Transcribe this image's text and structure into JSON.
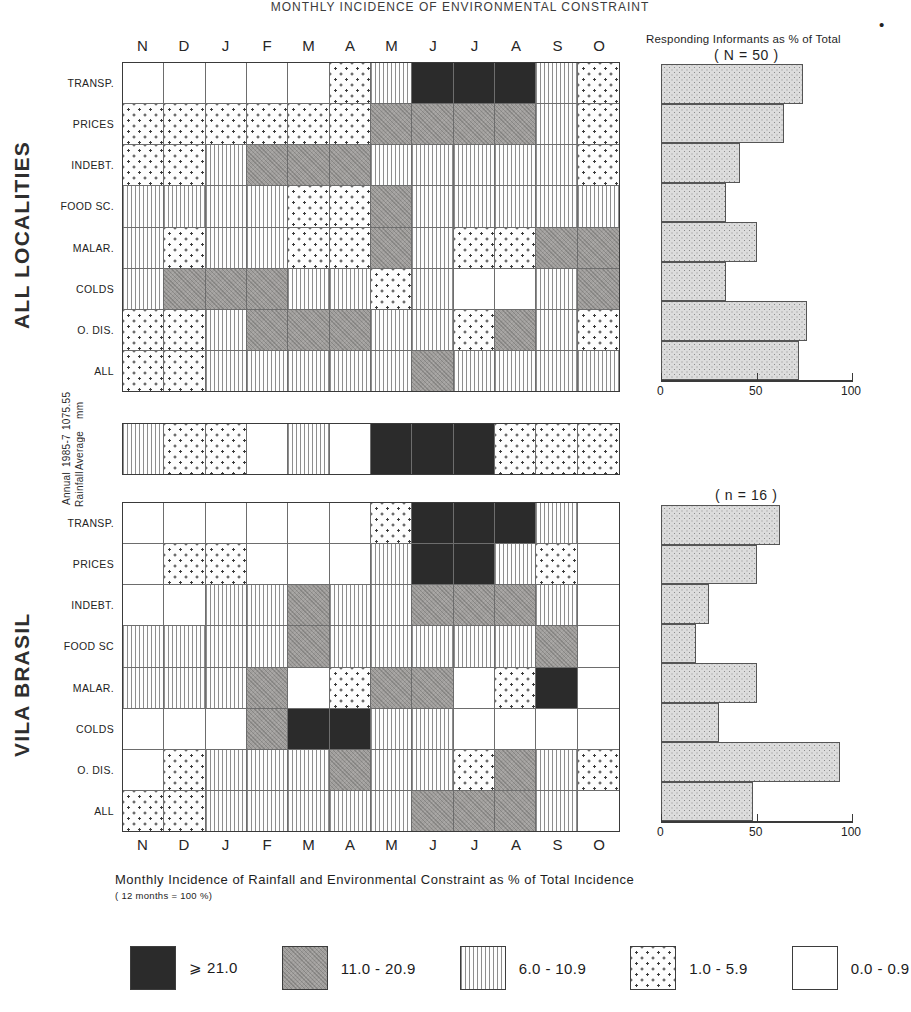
{
  "figure": {
    "top_title": "MONTHLY INCIDENCE OF ENVIRONMENTAL CONSTRAINT",
    "section_top_label": "ALL LOCALITIES",
    "section_bottom_label": "VILA BRASIL",
    "caption_line1": "Monthly Incidence of Rainfall and Environmental Constraint as % of Total Incidence",
    "caption_line2": "( 12 months = 100 %)",
    "asterisk": "•"
  },
  "months": [
    "N",
    "D",
    "J",
    "F",
    "M",
    "A",
    "M",
    "J",
    "J",
    "A",
    "S",
    "O"
  ],
  "constraint_rows": [
    "TRANSP.",
    "PRICES",
    "INDEBT.",
    "FOOD SC.",
    "MALAR.",
    "COLDS",
    "O. DIS.",
    "ALL"
  ],
  "constraint_rows_bottom": [
    "TRANSP.",
    "PRICES",
    "INDEBT.",
    "FOOD SC",
    "MALAR.",
    "COLDS",
    "O. DIS.",
    "ALL"
  ],
  "rainfall": {
    "label_line1": "Annual Rainfall",
    "label_line2": "1985-7 Average",
    "label_line3": "1075.55 mm"
  },
  "bar_panel_top": {
    "title": "Responding Informants as % of Total",
    "subtitle": "( N = 50 )",
    "axis_ticks": [
      "0",
      "50",
      "100"
    ]
  },
  "bar_panel_bottom": {
    "subtitle": "( n = 16 )",
    "axis_ticks": [
      "0",
      "50",
      "100"
    ]
  },
  "legend": {
    "items": [
      {
        "pattern": "black",
        "label": "⩾ 21.0"
      },
      {
        "pattern": "gray",
        "label": "11.0 - 20.9"
      },
      {
        "pattern": "lines",
        "label": "6.0 - 10.9"
      },
      {
        "pattern": "dots",
        "label": "1.0 - 5.9"
      },
      {
        "pattern": "white",
        "label": "0.0 - 0.9"
      }
    ]
  },
  "chart_data": {
    "type": "heatmap",
    "title": "Monthly Incidence of Rainfall and Environmental Constraint as % of Total Incidence",
    "subtitle": "( 12 months = 100 %)",
    "xlabel": "",
    "ylabel": "",
    "x": [
      "N",
      "D",
      "J",
      "F",
      "M",
      "A",
      "M",
      "J",
      "J",
      "A",
      "S",
      "O"
    ],
    "grid": true,
    "legend_position": "bottom",
    "class_bins": [
      {
        "name": "black",
        "range": "⩾ 21.0",
        "min": 21.0,
        "max": null
      },
      {
        "name": "gray",
        "range": "11.0 - 20.9",
        "min": 11.0,
        "max": 20.9
      },
      {
        "name": "lines",
        "range": "6.0 - 10.9",
        "min": 6.0,
        "max": 10.9
      },
      {
        "name": "dots",
        "range": "1.0 - 5.9",
        "min": 1.0,
        "max": 5.9
      },
      {
        "name": "white",
        "range": "0.0 - 0.9",
        "min": 0.0,
        "max": 0.9
      }
    ],
    "panels": [
      {
        "name": "ALL LOCALITIES",
        "rows": [
          "TRANSP.",
          "PRICES",
          "INDEBT.",
          "FOOD SC.",
          "MALAR.",
          "COLDS",
          "O. DIS.",
          "ALL"
        ],
        "values": [
          [
            "white",
            "white",
            "white",
            "white",
            "white",
            "dots",
            "lines",
            "black",
            "black",
            "black",
            "lines",
            "dots"
          ],
          [
            "dots",
            "dots",
            "dots",
            "dots",
            "dots",
            "dots",
            "gray",
            "gray",
            "gray",
            "gray",
            "lines",
            "dots"
          ],
          [
            "dots",
            "dots",
            "lines",
            "gray",
            "gray",
            "gray",
            "lines",
            "lines",
            "lines",
            "lines",
            "lines",
            "dots"
          ],
          [
            "lines",
            "lines",
            "lines",
            "lines",
            "dots",
            "dots",
            "gray",
            "lines",
            "lines",
            "lines",
            "lines",
            "lines"
          ],
          [
            "lines",
            "dots",
            "lines",
            "lines",
            "dots",
            "dots",
            "gray",
            "lines",
            "dots",
            "dots",
            "gray",
            "gray"
          ],
          [
            "lines",
            "gray",
            "gray",
            "gray",
            "lines",
            "lines",
            "dots",
            "lines",
            "white",
            "white",
            "lines",
            "gray"
          ],
          [
            "dots",
            "dots",
            "lines",
            "gray",
            "gray",
            "gray",
            "lines",
            "lines",
            "dots",
            "gray",
            "lines",
            "dots"
          ],
          [
            "dots",
            "dots",
            "lines",
            "lines",
            "lines",
            "lines",
            "lines",
            "gray",
            "lines",
            "lines",
            "lines",
            "lines"
          ]
        ]
      },
      {
        "name": "RAINFALL",
        "rows": [
          "Annual Rainfall 1985-7 Average 1075.55 mm"
        ],
        "values": [
          [
            "lines",
            "dots",
            "dots",
            "white",
            "lines",
            "white",
            "black",
            "black",
            "black",
            "dots",
            "dots",
            "dots"
          ]
        ]
      },
      {
        "name": "VILA BRASIL",
        "rows": [
          "TRANSP.",
          "PRICES",
          "INDEBT.",
          "FOOD SC",
          "MALAR.",
          "COLDS",
          "O. DIS.",
          "ALL"
        ],
        "values": [
          [
            "white",
            "white",
            "white",
            "white",
            "white",
            "white",
            "dots",
            "black",
            "black",
            "black",
            "lines",
            "white"
          ],
          [
            "white",
            "dots",
            "dots",
            "white",
            "white",
            "white",
            "lines",
            "black",
            "black",
            "lines",
            "dots",
            "white"
          ],
          [
            "white",
            "white",
            "lines",
            "lines",
            "gray",
            "lines",
            "lines",
            "gray",
            "gray",
            "gray",
            "lines",
            "white"
          ],
          [
            "lines",
            "lines",
            "lines",
            "lines",
            "gray",
            "lines",
            "lines",
            "lines",
            "lines",
            "lines",
            "gray",
            "white"
          ],
          [
            "lines",
            "lines",
            "lines",
            "gray",
            "white",
            "dots",
            "gray",
            "gray",
            "white",
            "dots",
            "black",
            "white"
          ],
          [
            "white",
            "white",
            "white",
            "gray",
            "black",
            "black",
            "lines",
            "lines",
            "white",
            "white",
            "white",
            "white"
          ],
          [
            "white",
            "dots",
            "lines",
            "lines",
            "lines",
            "gray",
            "lines",
            "lines",
            "dots",
            "gray",
            "lines",
            "dots"
          ],
          [
            "dots",
            "dots",
            "lines",
            "lines",
            "lines",
            "lines",
            "lines",
            "gray",
            "gray",
            "gray",
            "lines",
            "white"
          ]
        ]
      }
    ],
    "bar_charts": [
      {
        "type": "bar",
        "orientation": "horizontal",
        "name": "ALL LOCALITIES",
        "title": "Responding Informants as % of Total",
        "subtitle": "( N = 50 )",
        "categories": [
          "TRANSP.",
          "PRICES",
          "INDEBT.",
          "FOOD SC.",
          "MALAR.",
          "COLDS",
          "O. DIS.",
          "ALL"
        ],
        "values": [
          74,
          64,
          41,
          34,
          50,
          34,
          76,
          72
        ],
        "xlim": [
          0,
          100
        ],
        "xticks": [
          0,
          50,
          100
        ],
        "ylabel": "",
        "xlabel": ""
      },
      {
        "type": "bar",
        "orientation": "horizontal",
        "name": "VILA BRASIL",
        "subtitle": "( n = 16 )",
        "categories": [
          "TRANSP.",
          "PRICES",
          "INDEBT.",
          "FOOD SC",
          "MALAR.",
          "COLDS",
          "O. DIS.",
          "ALL"
        ],
        "values": [
          62,
          50,
          25,
          18,
          50,
          30,
          93,
          48
        ],
        "xlim": [
          0,
          100
        ],
        "xticks": [
          0,
          50,
          100
        ],
        "ylabel": "",
        "xlabel": ""
      }
    ]
  }
}
